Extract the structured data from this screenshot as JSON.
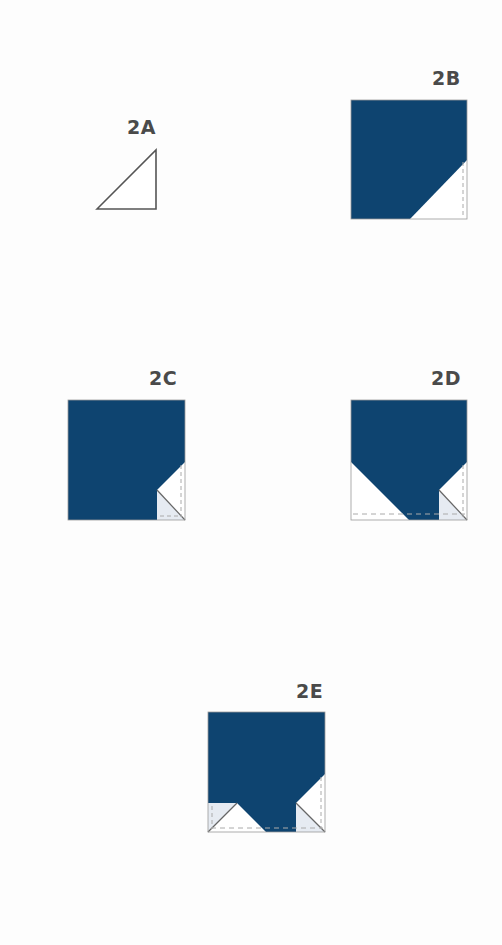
{
  "colors": {
    "fabric": "#0e4470",
    "fabric_dark": "#0b3a62",
    "background_fabric": "#ffffff",
    "fold_shade": "#e6ebf2",
    "outline": "#8a8a8a",
    "stroke": "#555555",
    "dashed": "#a8a8a8",
    "label": "#4a4a4a"
  },
  "steps": [
    {
      "id": "2A",
      "label": "2A",
      "description": "Half-square triangle outline"
    },
    {
      "id": "2B",
      "label": "2B",
      "description": "Square with bottom-right corner triangle folded/placed"
    },
    {
      "id": "2C",
      "label": "2C",
      "description": "Square with small corner triangle folded back in bottom-right"
    },
    {
      "id": "2D",
      "label": "2D",
      "description": "Square with bottom-left triangle added, bottom-right folded corner"
    },
    {
      "id": "2E",
      "label": "2E",
      "description": "Square with both bottom corners folded back"
    }
  ]
}
